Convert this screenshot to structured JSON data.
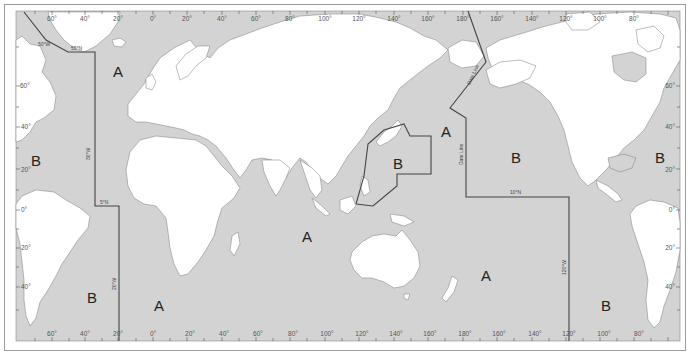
{
  "caption": "",
  "map": {
    "projection": "Mercator world map, Pacific-centered",
    "colors": {
      "ocean": "#d3d3d3",
      "land": "#ffffff",
      "coast": "#777777",
      "boundary": "#444444",
      "frame": "#9c9c9c"
    },
    "top_axis_labels": [
      "60°",
      "40°",
      "20°",
      "0°",
      "20°",
      "40°",
      "60°",
      "80°",
      "100°",
      "120°",
      "140°",
      "160°",
      "180°",
      "160°",
      "140°",
      "120°",
      "100°",
      "80°"
    ],
    "bottom_axis_labels": [
      "60°",
      "40°",
      "20°",
      "0°",
      "20°",
      "40°",
      "60°",
      "80°",
      "100°",
      "120°",
      "140°",
      "160°",
      "180°",
      "160°",
      "140°",
      "120°",
      "100°",
      "80°"
    ],
    "left_axis_labels": [
      "60°",
      "40°",
      "20°",
      "0°",
      "20°",
      "40°"
    ],
    "right_axis_labels": [
      "60°",
      "40°",
      "20°",
      "0°",
      "20°",
      "40°"
    ],
    "zones": [
      {
        "label": "A",
        "x": 118,
        "y": 72
      },
      {
        "label": "B",
        "x": 36,
        "y": 161
      },
      {
        "label": "B",
        "x": 92,
        "y": 298
      },
      {
        "label": "A",
        "x": 159,
        "y": 306
      },
      {
        "label": "A",
        "x": 307,
        "y": 237
      },
      {
        "label": "B",
        "x": 398,
        "y": 164
      },
      {
        "label": "A",
        "x": 446,
        "y": 132
      },
      {
        "label": "B",
        "x": 516,
        "y": 158
      },
      {
        "label": "A",
        "x": 486,
        "y": 276
      },
      {
        "label": "B",
        "x": 606,
        "y": 306
      },
      {
        "label": "B",
        "x": 660,
        "y": 158
      }
    ],
    "boundary_labels": {
      "lat_55n": "55°N",
      "lon_30w": "30°W",
      "lat_5n": "5°N",
      "lon_20w": "20°W",
      "date_line_upper": "Date Line",
      "date_line_lower": "Date Line",
      "lat_10n": "10°N",
      "lon_120w": "120°W",
      "lon_50w": "50°W"
    }
  }
}
